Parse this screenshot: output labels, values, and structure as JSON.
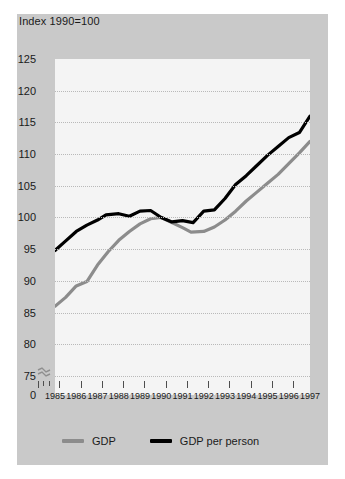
{
  "chart_data": {
    "type": "line",
    "title": "Index 1990=100",
    "xlabel": "",
    "ylabel": "",
    "grid": true,
    "legend_position": "bottom",
    "axis_break": true,
    "ylim": [
      75,
      125
    ],
    "yticks": [
      125,
      120,
      115,
      110,
      105,
      100,
      95,
      90,
      85,
      80,
      75,
      0
    ],
    "ytick_labels": [
      "125",
      "120",
      "115",
      "110",
      "105",
      "100",
      "95",
      "90",
      "85",
      "80",
      "75",
      "0"
    ],
    "x": [
      1985,
      1986,
      1987,
      1988,
      1989,
      1990,
      1991,
      1992,
      1993,
      1994,
      1995,
      1996,
      1997
    ],
    "xtick_labels": [
      "1985",
      "1986",
      "1987",
      "1988",
      "1989",
      "1990",
      "1991",
      "1992",
      "1993",
      "1994",
      "1995",
      "1996",
      "1997"
    ],
    "series": [
      {
        "name": "GDP",
        "color": "#8c8c8c",
        "values": [
          86.0,
          89.2,
          92.5,
          96.4,
          99.0,
          100.0,
          98.4,
          97.8,
          99.6,
          102.6,
          105.4,
          108.5,
          112.0
        ],
        "points": [
          {
            "x": 1985.0,
            "y": 86.0
          },
          {
            "x": 1985.5,
            "y": 87.4
          },
          {
            "x": 1986.0,
            "y": 89.2
          },
          {
            "x": 1986.5,
            "y": 89.9
          },
          {
            "x": 1987.0,
            "y": 92.5
          },
          {
            "x": 1987.5,
            "y": 94.6
          },
          {
            "x": 1988.0,
            "y": 96.4
          },
          {
            "x": 1988.5,
            "y": 97.8
          },
          {
            "x": 1989.0,
            "y": 99.0
          },
          {
            "x": 1989.5,
            "y": 99.8
          },
          {
            "x": 1990.0,
            "y": 100.0
          },
          {
            "x": 1990.5,
            "y": 99.2
          },
          {
            "x": 1991.0,
            "y": 98.4
          },
          {
            "x": 1991.4,
            "y": 97.7
          },
          {
            "x": 1992.0,
            "y": 97.8
          },
          {
            "x": 1992.5,
            "y": 98.5
          },
          {
            "x": 1993.0,
            "y": 99.6
          },
          {
            "x": 1993.5,
            "y": 101.0
          },
          {
            "x": 1994.0,
            "y": 102.6
          },
          {
            "x": 1994.5,
            "y": 104.0
          },
          {
            "x": 1995.0,
            "y": 105.4
          },
          {
            "x": 1995.5,
            "y": 106.8
          },
          {
            "x": 1996.0,
            "y": 108.5
          },
          {
            "x": 1996.5,
            "y": 110.2
          },
          {
            "x": 1997.0,
            "y": 112.0
          }
        ]
      },
      {
        "name": "GDP per person",
        "color": "#000000",
        "values": [
          94.8,
          97.8,
          99.6,
          100.6,
          101.0,
          100.0,
          99.5,
          101.0,
          103.0,
          106.6,
          109.8,
          112.6,
          116.0
        ],
        "points": [
          {
            "x": 1985.0,
            "y": 94.8
          },
          {
            "x": 1985.4,
            "y": 96.0
          },
          {
            "x": 1986.0,
            "y": 97.8
          },
          {
            "x": 1986.5,
            "y": 98.8
          },
          {
            "x": 1987.0,
            "y": 99.6
          },
          {
            "x": 1987.4,
            "y": 100.4
          },
          {
            "x": 1988.0,
            "y": 100.6
          },
          {
            "x": 1988.5,
            "y": 100.2
          },
          {
            "x": 1989.0,
            "y": 101.0
          },
          {
            "x": 1989.5,
            "y": 101.1
          },
          {
            "x": 1990.0,
            "y": 100.0
          },
          {
            "x": 1990.5,
            "y": 99.3
          },
          {
            "x": 1991.0,
            "y": 99.5
          },
          {
            "x": 1991.5,
            "y": 99.2
          },
          {
            "x": 1992.0,
            "y": 101.0
          },
          {
            "x": 1992.5,
            "y": 101.2
          },
          {
            "x": 1993.0,
            "y": 103.0
          },
          {
            "x": 1993.5,
            "y": 105.2
          },
          {
            "x": 1994.0,
            "y": 106.6
          },
          {
            "x": 1994.5,
            "y": 108.2
          },
          {
            "x": 1995.0,
            "y": 109.8
          },
          {
            "x": 1995.5,
            "y": 111.2
          },
          {
            "x": 1996.0,
            "y": 112.6
          },
          {
            "x": 1996.5,
            "y": 113.4
          },
          {
            "x": 1997.0,
            "y": 116.0
          }
        ]
      }
    ]
  },
  "legend": {
    "entries": [
      {
        "label": "GDP",
        "color": "#8c8c8c"
      },
      {
        "label": "GDP per person",
        "color": "#000000"
      }
    ]
  },
  "colors": {
    "panel": "#c9c9c9",
    "plot": "#f4f4f4",
    "grid": "#b9b9b9",
    "text": "#1a1a1a",
    "gdp": "#8c8c8c",
    "gdp_per_person": "#000000"
  }
}
